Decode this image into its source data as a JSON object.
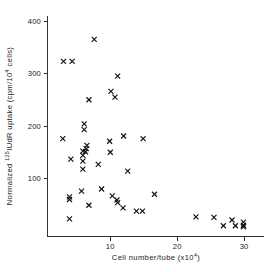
{
  "figure": {
    "background_color": "#ffffff",
    "marker_color": "#111111",
    "axis_color": "#333333",
    "marker_symbol": "x"
  },
  "axes": {
    "x_title_prefix": "Cell number/tube (x10",
    "x_title_sup": "4",
    "x_title_suffix": ")",
    "x_title_full": "Cell number/tube (x10⁴)",
    "y_title_part1": "Normalized ",
    "y_title_sup1": "125",
    "y_title_part2": "IUdR uptake (cpm/10",
    "y_title_sup2": "4",
    "y_title_part3": " cells)",
    "y_title_full": "Normalized ¹²⁵IUdR uptake (cpm/10⁴ cells)",
    "x_ticks": [
      "10",
      "20",
      "30"
    ],
    "x_tick_values": [
      10,
      20,
      30
    ],
    "y_ticks": [
      "100",
      "200",
      "300",
      "400"
    ],
    "y_tick_values": [
      100,
      200,
      300,
      400
    ]
  },
  "chart_data": {
    "type": "scatter",
    "title": "",
    "subtitle": "",
    "xlabel": "Cell number/tube (x10⁴)",
    "ylabel": "Normalized ¹²⁵IUdR uptake (cpm/10⁴ cells)",
    "xlim": [
      0,
      32
    ],
    "ylim": [
      0,
      400
    ],
    "grid": false,
    "legend": null,
    "marker": "x",
    "series": [
      {
        "name": "IUdR uptake",
        "points": [
          [
            7.6,
            365
          ],
          [
            3.0,
            323
          ],
          [
            4.3,
            323
          ],
          [
            11.1,
            295
          ],
          [
            10.1,
            266
          ],
          [
            10.7,
            255
          ],
          [
            6.8,
            250
          ],
          [
            6.1,
            204
          ],
          [
            6.1,
            193
          ],
          [
            12.0,
            181
          ],
          [
            14.9,
            176
          ],
          [
            2.9,
            176
          ],
          [
            9.9,
            171
          ],
          [
            6.5,
            163
          ],
          [
            6.4,
            157
          ],
          [
            5.9,
            152
          ],
          [
            6.3,
            151
          ],
          [
            10.0,
            150
          ],
          [
            5.9,
            144
          ],
          [
            4.1,
            137
          ],
          [
            5.9,
            133
          ],
          [
            8.2,
            127
          ],
          [
            12.6,
            114
          ],
          [
            5.9,
            118
          ],
          [
            8.7,
            80
          ],
          [
            5.7,
            76
          ],
          [
            16.6,
            70
          ],
          [
            10.3,
            67
          ],
          [
            3.9,
            65
          ],
          [
            3.9,
            60
          ],
          [
            11.0,
            59
          ],
          [
            11.1,
            54
          ],
          [
            6.8,
            49
          ],
          [
            11.9,
            44
          ],
          [
            13.9,
            38
          ],
          [
            14.8,
            38
          ],
          [
            22.8,
            27
          ],
          [
            3.9,
            23
          ],
          [
            25.5,
            26
          ],
          [
            28.2,
            21
          ],
          [
            26.9,
            10
          ],
          [
            28.7,
            10
          ],
          [
            29.9,
            17
          ],
          [
            29.9,
            11
          ],
          [
            29.9,
            8
          ]
        ]
      }
    ]
  }
}
